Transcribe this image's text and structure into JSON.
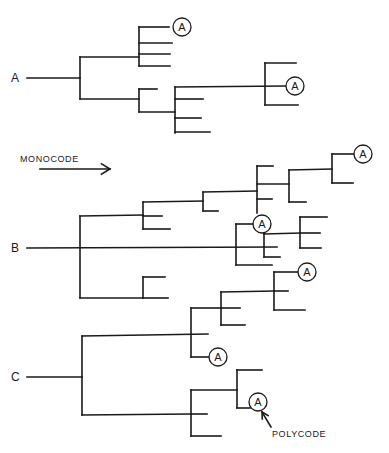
{
  "figure": {
    "width": 389,
    "height": 453,
    "ink_color": "#1a1a1a",
    "background": "#ffffff"
  },
  "annotations": {
    "monocode": {
      "label": "MONOCODE",
      "x": 20,
      "y": 162
    },
    "monocode_arrow": {
      "x1": 40,
      "y1": 169,
      "x2": 110,
      "y2": 169
    },
    "polycode": {
      "label": "POLYCODE",
      "x": 272,
      "y": 437
    },
    "polycode_arrow": {
      "x1": 271,
      "y1": 427,
      "x2": 262,
      "y2": 412
    }
  },
  "trees": [
    {
      "id": "A",
      "label": "A",
      "label_pos": {
        "x": 11,
        "y": 82
      },
      "lines": [
        [
          27,
          78,
          80,
          78
        ],
        [
          80,
          57,
          80,
          99
        ],
        [
          80,
          57,
          139,
          57
        ],
        [
          139,
          27,
          139,
          66
        ],
        [
          139,
          27,
          169,
          27
        ],
        [
          139,
          43,
          172,
          43
        ],
        [
          139,
          54,
          170,
          54
        ],
        [
          139,
          66,
          170,
          66
        ],
        [
          80,
          99,
          139,
          99
        ],
        [
          139,
          89,
          139,
          112
        ],
        [
          139,
          89,
          157,
          89
        ],
        [
          139,
          112,
          175,
          112
        ],
        [
          175,
          87,
          175,
          133
        ],
        [
          175,
          87,
          286,
          86
        ],
        [
          175,
          99,
          203,
          99
        ],
        [
          175,
          118,
          201,
          118
        ],
        [
          175,
          132,
          210,
          132
        ],
        [
          265,
          63,
          265,
          105
        ],
        [
          265,
          63,
          296,
          63
        ],
        [
          265,
          105,
          298,
          105
        ]
      ],
      "circled_nodes": [
        {
          "label": "A",
          "cx": 182,
          "cy": 27
        },
        {
          "label": "A",
          "cx": 295,
          "cy": 86
        }
      ]
    },
    {
      "id": "B",
      "label": "B",
      "label_pos": {
        "x": 11,
        "y": 252
      },
      "lines": [
        [
          27,
          248,
          277,
          247
        ],
        [
          80,
          216,
          80,
          298
        ],
        [
          80,
          216,
          143,
          215
        ],
        [
          143,
          202,
          143,
          229
        ],
        [
          143,
          216,
          162,
          216
        ],
        [
          143,
          229,
          170,
          229
        ],
        [
          143,
          202,
          203,
          201
        ],
        [
          203,
          192,
          203,
          211
        ],
        [
          203,
          211,
          218,
          211
        ],
        [
          203,
          192,
          257,
          191
        ],
        [
          257,
          166,
          257,
          213
        ],
        [
          257,
          166,
          273,
          166
        ],
        [
          257,
          184,
          289,
          184
        ],
        [
          257,
          199,
          272,
          199
        ],
        [
          289,
          170,
          289,
          202
        ],
        [
          289,
          202,
          306,
          202
        ],
        [
          289,
          170,
          332,
          169
        ],
        [
          332,
          154,
          332,
          183
        ],
        [
          332,
          183,
          353,
          183
        ],
        [
          332,
          154,
          354,
          154
        ],
        [
          236,
          224,
          236,
          265
        ],
        [
          236,
          224,
          253,
          224
        ],
        [
          236,
          265,
          272,
          265
        ],
        [
          264,
          233,
          264,
          257
        ],
        [
          264,
          257,
          280,
          257
        ],
        [
          264,
          234,
          300,
          233
        ],
        [
          300,
          217,
          300,
          248
        ],
        [
          300,
          217,
          327,
          217
        ],
        [
          300,
          233,
          320,
          233
        ],
        [
          300,
          248,
          321,
          248
        ],
        [
          80,
          298,
          143,
          298
        ],
        [
          143,
          277,
          143,
          298
        ],
        [
          143,
          277,
          165,
          277
        ],
        [
          143,
          298,
          168,
          298
        ]
      ],
      "circled_nodes": [
        {
          "label": "A",
          "cx": 363,
          "cy": 154
        },
        {
          "label": "A",
          "cx": 262,
          "cy": 224
        }
      ]
    },
    {
      "id": "C",
      "label": "C",
      "label_pos": {
        "x": 11,
        "y": 381
      },
      "lines": [
        [
          27,
          377,
          82,
          377
        ],
        [
          82,
          336,
          82,
          415
        ],
        [
          82,
          336,
          208,
          334
        ],
        [
          191,
          308,
          191,
          357
        ],
        [
          191,
          357,
          209,
          357
        ],
        [
          191,
          308,
          221,
          308
        ],
        [
          221,
          292,
          221,
          325
        ],
        [
          221,
          308,
          240,
          308
        ],
        [
          221,
          325,
          245,
          325
        ],
        [
          221,
          292,
          274,
          291
        ],
        [
          274,
          272,
          274,
          310
        ],
        [
          274,
          272,
          298,
          272
        ],
        [
          274,
          291,
          288,
          291
        ],
        [
          274,
          310,
          305,
          310
        ],
        [
          82,
          415,
          191,
          414
        ],
        [
          191,
          390,
          191,
          436
        ],
        [
          191,
          414,
          207,
          414
        ],
        [
          191,
          436,
          221,
          436
        ],
        [
          191,
          390,
          237,
          390
        ],
        [
          237,
          370,
          237,
          408
        ],
        [
          237,
          370,
          262,
          370
        ],
        [
          237,
          408,
          250,
          408
        ]
      ],
      "circled_nodes": [
        {
          "label": "A",
          "cx": 307,
          "cy": 272
        },
        {
          "label": "A",
          "cx": 218,
          "cy": 357
        },
        {
          "label": "A",
          "cx": 258,
          "cy": 402
        }
      ]
    }
  ]
}
